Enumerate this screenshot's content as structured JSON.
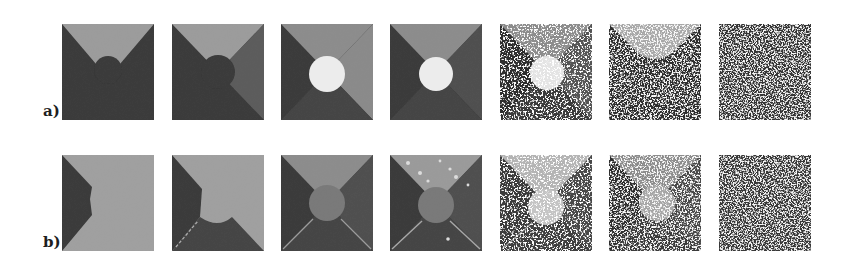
{
  "figure": {
    "rows": [
      {
        "label": "a)",
        "description": "Segmentation results, row a: three-region wedge image with circle; noise increases left to right",
        "panels": [
          {
            "index": 1,
            "content": "top light wedge, dark rest, dark bump at center"
          },
          {
            "index": 2,
            "content": "top light wedge, right mid-gray wedge, dark left/bottom, dark circle"
          },
          {
            "index": 3,
            "content": "four wedges with bright white circle"
          },
          {
            "index": 4,
            "content": "four wedges with bright white circle"
          },
          {
            "index": 5,
            "content": "four wedges with white circle, speckled noise"
          },
          {
            "index": 6,
            "content": "light top wedge, heavy speckle below"
          },
          {
            "index": 7,
            "content": "pure noise"
          }
        ]
      },
      {
        "label": "b)",
        "description": "Segmentation results, row b",
        "panels": [
          {
            "index": 1,
            "content": "dark left region, light rest"
          },
          {
            "index": 2,
            "content": "dark left, light top/right, dark bottom, light circle merged"
          },
          {
            "index": 3,
            "content": "four wedges, mid-gray circle"
          },
          {
            "index": 4,
            "content": "four wedges, mid-gray circle, light speckles on top"
          },
          {
            "index": 5,
            "content": "four wedges, light noisy circle"
          },
          {
            "index": 6,
            "content": "noisy wedges, light circle"
          },
          {
            "index": 7,
            "content": "pure noise"
          }
        ]
      }
    ],
    "colors": {
      "dark": "#3a3a3a",
      "mid_dark": "#585858",
      "mid": "#7a7a7a",
      "light": "#9c9c9c",
      "white": "#ececec",
      "label": "#1e1e1e"
    }
  }
}
